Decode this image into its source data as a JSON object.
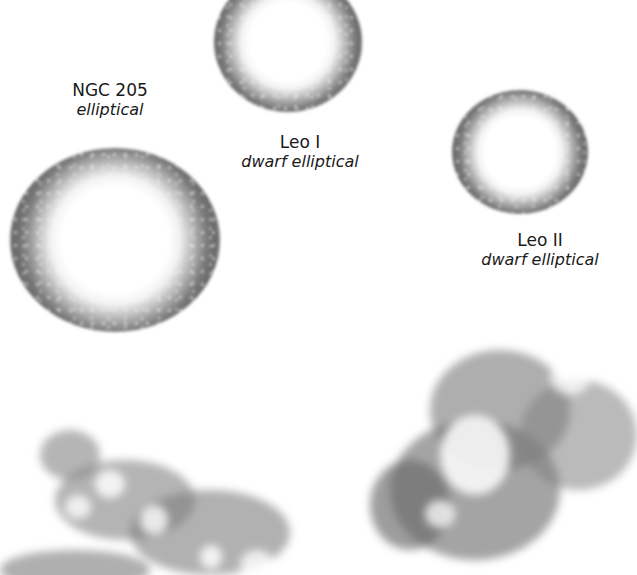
{
  "galaxies": [
    {
      "name": "NGC 205",
      "type": "elliptical"
    },
    {
      "name": "Leo I",
      "type": "dwarf elliptical"
    },
    {
      "name": "Leo II",
      "type": "dwarf elliptical"
    }
  ],
  "colors": {
    "background": "#ffffff",
    "text": "#1a1a1a",
    "halo_dark": "#6a6a6a",
    "core": "#ffffff"
  }
}
